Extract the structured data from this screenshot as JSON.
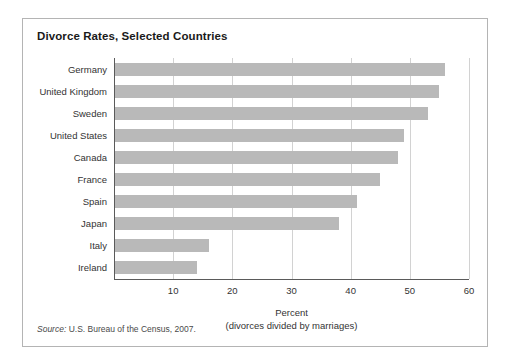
{
  "figure": {
    "title": "Divorce Rates, Selected Countries",
    "source_prefix": "Source:",
    "source_text": " U.S. Bureau of the Census, 2007."
  },
  "chart_data": {
    "type": "bar",
    "orientation": "horizontal",
    "title": "Divorce Rates, Selected Countries",
    "xlabel_line1": "Percent",
    "xlabel_line2": "(divorces divided by marriages)",
    "ylabel": "",
    "categories": [
      "Germany",
      "United Kingdom",
      "Sweden",
      "United States",
      "Canada",
      "France",
      "Spain",
      "Japan",
      "Italy",
      "Ireland"
    ],
    "values": [
      56,
      55,
      53,
      49,
      48,
      45,
      41,
      38,
      16,
      14
    ],
    "xlim": [
      0,
      60
    ],
    "xticks": [
      10,
      20,
      30,
      40,
      50,
      60
    ],
    "xtick_labels": [
      "10",
      "20",
      "30",
      "40",
      "50",
      "60"
    ],
    "grid": true,
    "grid_axis": "x",
    "legend": false,
    "bar_color": "#b9b9b9",
    "gridline_color": "#d2d2d2",
    "axis_color": "#5a5a5a",
    "background": "#ffffff",
    "border_color": "#b4b4b4"
  }
}
